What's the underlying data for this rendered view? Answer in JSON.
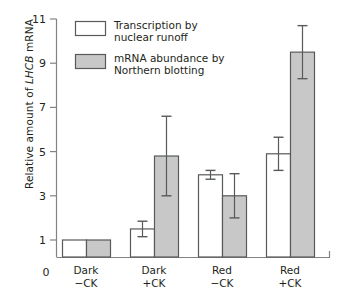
{
  "chart_data": {
    "type": "bar",
    "title": "",
    "xlabel": "",
    "ylabel": "Relative amount of LHCB mRNA",
    "ylabel_italic_part": "LHCB",
    "ylabel_prefix": "Relative amount of ",
    "ylabel_suffix": " mRNA",
    "ylim": [
      0,
      11
    ],
    "yticks": [
      1,
      3,
      5,
      7,
      9,
      11
    ],
    "ytick_labels": [
      "1",
      "3",
      "5",
      "7",
      "9",
      "11"
    ],
    "y_origin_label": "0",
    "grid": false,
    "axis_break": true,
    "categories": [
      "Dark−CK",
      "Dark+CK",
      "Red−CK",
      "Red+CK"
    ],
    "category_lines": [
      [
        "Dark",
        "−CK"
      ],
      [
        "Dark",
        "+CK"
      ],
      [
        "Red",
        "−CK"
      ],
      [
        "Red",
        "+CK"
      ]
    ],
    "series": [
      {
        "name": "Transcription by nuclear runoff",
        "name_lines": [
          "Transcription by",
          "nuclear runoff"
        ],
        "fill": "#ffffff",
        "stroke": "#58595b",
        "values": [
          1.0,
          1.5,
          3.95,
          4.9
        ],
        "errors": [
          0.0,
          0.35,
          0.2,
          0.75
        ]
      },
      {
        "name": "mRNA abundance by Northern blotting",
        "name_lines": [
          "mRNA abundance by",
          "Northern blotting"
        ],
        "fill": "#c8c8c8",
        "stroke": "#58595b",
        "values": [
          1.0,
          4.8,
          3.0,
          9.5
        ],
        "errors": [
          0.0,
          1.8,
          1.0,
          1.2
        ]
      }
    ],
    "legend_position": "top-left",
    "colors": {
      "axis": "#808285",
      "bar_outline": "#58595b",
      "error_bar": "#58595b",
      "series1_fill": "#ffffff",
      "series2_fill": "#c8c8c8",
      "text": "#231f20"
    }
  }
}
